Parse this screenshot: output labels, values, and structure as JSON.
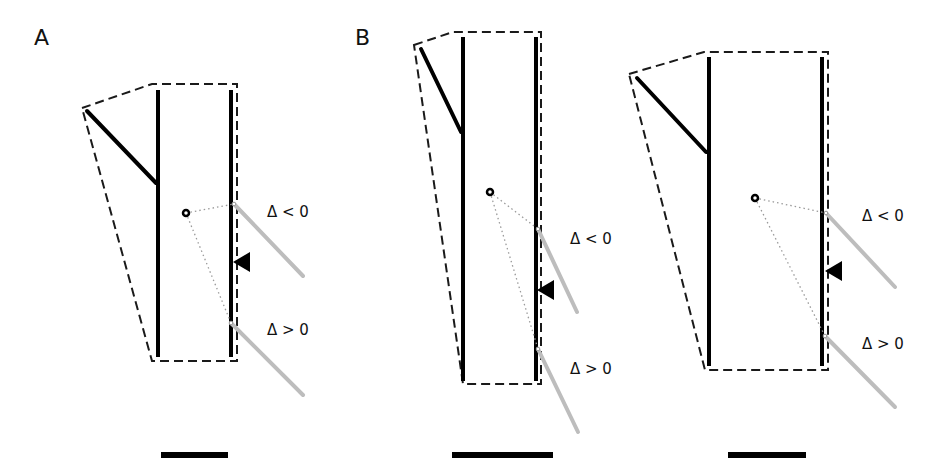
{
  "figure": {
    "panel_labels": {
      "A": "A",
      "B": "B"
    },
    "delta_negative": "Δ < 0",
    "delta_positive": "Δ > 0",
    "colors": {
      "line": "#000000",
      "outline": "#1a1a1a",
      "probe": "#bdbdbd",
      "ray": "#9a9a9a",
      "background": "#ffffff"
    },
    "icons": {
      "focus-point": "small open circle",
      "wall-arrow": "black triangle pointing left",
      "probe": "gray diagonal line"
    },
    "diagrams": [
      {
        "id": "A",
        "outline": "82,108 152,84 237,84 237,361 152,361",
        "left_stem": {
          "x": 158,
          "y1": 90,
          "y2": 357
        },
        "right_stem": {
          "x": 231,
          "y1": 90,
          "y2": 357
        },
        "branch": {
          "x1": 87,
          "y1": 111,
          "x2": 156,
          "y2": 183
        },
        "dot": {
          "x": 186,
          "y": 213
        },
        "probe_upper": {
          "x1": 234,
          "y1": 204,
          "x2": 303,
          "y2": 276
        },
        "probe_lower": {
          "x1": 231,
          "y1": 323,
          "x2": 303,
          "y2": 395
        },
        "arrow": {
          "x": 233,
          "y": 262
        },
        "label_neg": {
          "x": 267,
          "y": 217
        },
        "label_pos": {
          "x": 267,
          "y": 335
        },
        "scale_bar": {
          "x": 161,
          "y": 452,
          "w": 67
        }
      },
      {
        "id": "B1",
        "outline": "414,45 453,32 541,32 541,384 463,384",
        "left_stem": {
          "x": 463,
          "y1": 37,
          "y2": 381
        },
        "right_stem": {
          "x": 536,
          "y1": 37,
          "y2": 381
        },
        "branch": {
          "x1": 421,
          "y1": 49,
          "x2": 461,
          "y2": 132
        },
        "dot": {
          "x": 490,
          "y": 192
        },
        "probe_upper": {
          "x1": 538,
          "y1": 229,
          "x2": 577,
          "y2": 312
        },
        "probe_lower": {
          "x1": 538,
          "y1": 349,
          "x2": 578,
          "y2": 432
        },
        "arrow": {
          "x": 537,
          "y": 290
        },
        "label_neg": {
          "x": 570,
          "y": 244
        },
        "label_pos": {
          "x": 570,
          "y": 374
        },
        "scale_bar": {
          "x": 452,
          "y": 452,
          "w": 101
        }
      },
      {
        "id": "B2",
        "outline": "629,74 704,52 828,52 828,370 705,370",
        "left_stem": {
          "x": 709,
          "y1": 57,
          "y2": 366
        },
        "right_stem": {
          "x": 822,
          "y1": 57,
          "y2": 366
        },
        "branch": {
          "x1": 637,
          "y1": 78,
          "x2": 706,
          "y2": 152
        },
        "dot": {
          "x": 755,
          "y": 198
        },
        "probe_upper": {
          "x1": 826,
          "y1": 213,
          "x2": 895,
          "y2": 287
        },
        "probe_lower": {
          "x1": 825,
          "y1": 336,
          "x2": 895,
          "y2": 407
        },
        "arrow": {
          "x": 825,
          "y": 271
        },
        "label_neg": {
          "x": 862,
          "y": 221
        },
        "label_pos": {
          "x": 862,
          "y": 349
        },
        "scale_bar": {
          "x": 728,
          "y": 452,
          "w": 78
        }
      }
    ]
  }
}
